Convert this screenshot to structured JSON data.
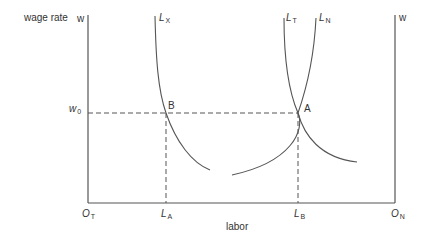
{
  "figure": {
    "y_axis_label": "wage rate",
    "x_axis_label": "labor",
    "left_axis_symbol": "w",
    "right_axis_symbol": "w",
    "wage_level_label": {
      "main": "w",
      "sub": "0"
    },
    "origins": {
      "left": {
        "main": "O",
        "sub": "T"
      },
      "right": {
        "main": "O",
        "sub": "N"
      }
    },
    "labor_points": {
      "a": {
        "main": "L",
        "sub": "A"
      },
      "b": {
        "main": "L",
        "sub": "B"
      }
    },
    "curves": {
      "lx": {
        "main": "L",
        "sub": "X"
      },
      "lt": {
        "main": "L",
        "sub": "T"
      },
      "ln": {
        "main": "L",
        "sub": "N"
      }
    },
    "points": {
      "a": "A",
      "b": "B"
    },
    "colors": {
      "line": "#555555",
      "text": "#333333",
      "background": "#ffffff"
    }
  }
}
